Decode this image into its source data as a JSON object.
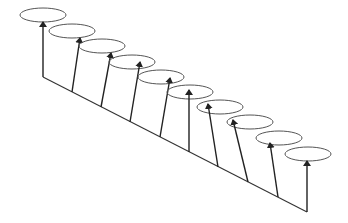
{
  "diagram": {
    "stroke_color": "#333333",
    "ellipse_color": "#555555",
    "baseline": {
      "x1": 43,
      "y1": 77,
      "x2": 307,
      "y2": 212
    },
    "ellipses": [
      {
        "cx": 43,
        "cy": 15,
        "rx": 23,
        "ry": 7,
        "base_x": 43,
        "base_y": 77,
        "tip_x": 43,
        "tip_y": 22
      },
      {
        "cx": 72,
        "cy": 31,
        "rx": 23,
        "ry": 7,
        "base_x": 72,
        "base_y": 92,
        "tip_x": 80,
        "tip_y": 38
      },
      {
        "cx": 102,
        "cy": 46,
        "rx": 23,
        "ry": 7,
        "base_x": 101,
        "base_y": 107,
        "tip_x": 111,
        "tip_y": 53
      },
      {
        "cx": 132,
        "cy": 62,
        "rx": 23,
        "ry": 7,
        "base_x": 130,
        "base_y": 122,
        "tip_x": 140,
        "tip_y": 62
      },
      {
        "cx": 161,
        "cy": 77,
        "rx": 23,
        "ry": 7,
        "base_x": 160,
        "base_y": 137,
        "tip_x": 170,
        "tip_y": 78
      },
      {
        "cx": 190,
        "cy": 92,
        "rx": 23,
        "ry": 7,
        "base_x": 189,
        "base_y": 152,
        "tip_x": 189,
        "tip_y": 90
      },
      {
        "cx": 220,
        "cy": 107,
        "rx": 23,
        "ry": 7,
        "base_x": 218,
        "base_y": 167,
        "tip_x": 208,
        "tip_y": 104
      },
      {
        "cx": 250,
        "cy": 122,
        "rx": 23,
        "ry": 7,
        "base_x": 248,
        "base_y": 182,
        "tip_x": 233,
        "tip_y": 120
      },
      {
        "cx": 279,
        "cy": 138,
        "rx": 23,
        "ry": 7,
        "base_x": 278,
        "base_y": 197,
        "tip_x": 270,
        "tip_y": 143
      },
      {
        "cx": 308,
        "cy": 154,
        "rx": 23,
        "ry": 7,
        "base_x": 307,
        "base_y": 212,
        "tip_x": 307,
        "tip_y": 161
      }
    ]
  }
}
